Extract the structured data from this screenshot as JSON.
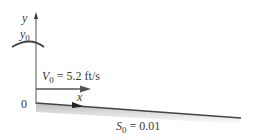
{
  "diagram": {
    "axes": {
      "y_label": "y",
      "x_label": "x",
      "origin_label": "0"
    },
    "surface": {
      "depth_symbol": "y",
      "depth_subscript": "0"
    },
    "velocity": {
      "symbol": "V",
      "subscript": "0",
      "value_text": "= 5.2 ft/s"
    },
    "slope": {
      "symbol": "S",
      "subscript": "0",
      "value_text": "= 0.01"
    },
    "colors": {
      "line": "#444444",
      "text": "#3a3a3a",
      "shade": "#d8d8d8"
    }
  }
}
